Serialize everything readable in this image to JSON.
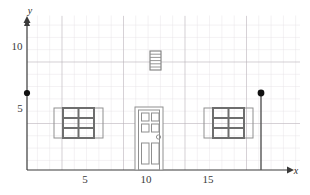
{
  "figure": {
    "axes": {
      "x_axis_label": "x",
      "y_axis_label": "y",
      "x_ticks": [
        {
          "value": 5,
          "label": "5"
        },
        {
          "value": 10,
          "label": "10"
        },
        {
          "value": 15,
          "label": "15"
        }
      ],
      "y_ticks": [
        {
          "value": 5,
          "label": "5"
        },
        {
          "value": 10,
          "label": "10"
        }
      ],
      "x_range": [
        0,
        20
      ],
      "y_range": [
        0,
        13
      ],
      "grid": "on",
      "minor_grid_step": 1,
      "major_grid_step": 5,
      "arrow_x": true,
      "arrow_y": true
    },
    "colors": {
      "minor_grid": "#d9d4d9",
      "major_grid": "#b0a8b0",
      "axis": "#3a3a3a",
      "outline": "#8c8c8c",
      "dark_outline": "#6b6b6b",
      "point": "#111111",
      "background": "#ffffff"
    },
    "points": [
      {
        "name": "left-endpoint",
        "x": 0,
        "y": 6.05,
        "style": "filled"
      },
      {
        "name": "right-endpoint",
        "x": 19,
        "y": 6.05,
        "style": "filled"
      }
    ],
    "segments": [
      {
        "name": "right-vertical-edge",
        "x1": 19,
        "y1": 0,
        "x2": 19,
        "y2": 6.05
      }
    ],
    "objects": [
      {
        "name": "vent",
        "type": "louvered-vent",
        "x": 9.55,
        "y": 8.2,
        "width": 0.9,
        "height": 1.6,
        "slats": 6
      },
      {
        "name": "left-window",
        "type": "window",
        "x": 2.6,
        "y": 2.6,
        "width": 3.9,
        "height": 2.3,
        "panes_cols": 2,
        "panes_rows": 3
      },
      {
        "name": "right-window",
        "type": "window",
        "x": 13.7,
        "y": 2.6,
        "width": 3.9,
        "height": 2.3,
        "panes_cols": 2,
        "panes_rows": 3
      },
      {
        "name": "front-door",
        "type": "door",
        "x": 8.75,
        "y": 0,
        "width": 2.2,
        "height": 5.1,
        "top_panels": 4,
        "bottom_panels": 2,
        "knob": true
      }
    ]
  }
}
